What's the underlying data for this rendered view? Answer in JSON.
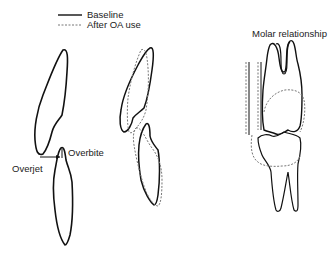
{
  "legend": {
    "items": [
      {
        "label": "Baseline",
        "style": "solid"
      },
      {
        "label": "After OA use",
        "style": "dashed"
      }
    ]
  },
  "labels": {
    "overjet": "Overjet",
    "overbite": "Overbite",
    "molar": "Molar relationship"
  },
  "colors": {
    "line": "#111111",
    "dashed": "#777777"
  }
}
